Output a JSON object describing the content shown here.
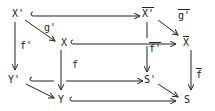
{
  "diagram": {
    "type": "commutative-cube",
    "nodes": {
      "x_prime": "X'",
      "xbar_prime": "X'",
      "x": "X",
      "xbar": "X",
      "y_prime": "Y'",
      "s_prime": "S'",
      "y": "Y",
      "s": "S"
    },
    "arrow_labels": {
      "g_prime": "g'",
      "gbar_prime": "g'",
      "f_prime": "f'",
      "fbar_prime": "f'",
      "f": "f",
      "fbar": "f"
    },
    "colors": {
      "ink": "#222222",
      "background": "#ffffff"
    }
  }
}
